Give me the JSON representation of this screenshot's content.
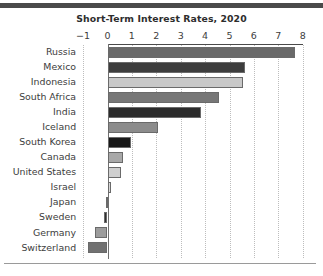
{
  "figure": {
    "title": "Short-Term Interest Rates, 2020",
    "background": "#ffffff",
    "rule_color": "#4a4a4a"
  },
  "axis": {
    "tick_labels": [
      "−1",
      "0",
      "1",
      "2",
      "3",
      "4",
      "5",
      "6",
      "7",
      "8"
    ],
    "tick_values": [
      -1,
      0,
      1,
      2,
      3,
      4,
      5,
      6,
      7,
      8
    ],
    "xmin": -1,
    "xmax": 8,
    "grid": "vertical dotted gridlines at every integer tick",
    "grid_color": "#bdbdbd",
    "zero_line_color": "#6f6f6f"
  },
  "chart_data": {
    "type": "bar",
    "orientation": "horizontal",
    "title": "Short-Term Interest Rates, 2020",
    "xlabel": "",
    "ylabel": "",
    "xlim": [
      -1,
      8
    ],
    "grid": true,
    "legend": "none",
    "categories": [
      "Russia",
      "Mexico",
      "Indonesia",
      "South Africa",
      "India",
      "Iceland",
      "South Korea",
      "Canada",
      "United States",
      "Israel",
      "Japan",
      "Sweden",
      "Germany",
      "Switzerland"
    ],
    "values": [
      7.7,
      5.65,
      5.55,
      4.55,
      3.85,
      2.05,
      0.95,
      0.65,
      0.55,
      0.15,
      -0.05,
      -0.15,
      -0.5,
      -0.78
    ],
    "colors": [
      "#696969",
      "#3d3d3d",
      "#c8c8c8",
      "#777777",
      "#2b2b2b",
      "#8c8c8c",
      "#181818",
      "#a8a8a8",
      "#cfcfcf",
      "#d8d8d8",
      "#e6e6e6",
      "#303030",
      "#9c9c9c",
      "#717171"
    ],
    "bar_edge_color": "#6a6a6a",
    "tick_labels": [
      "-1",
      "0",
      "1",
      "2",
      "3",
      "4",
      "5",
      "6",
      "7",
      "8"
    ]
  }
}
